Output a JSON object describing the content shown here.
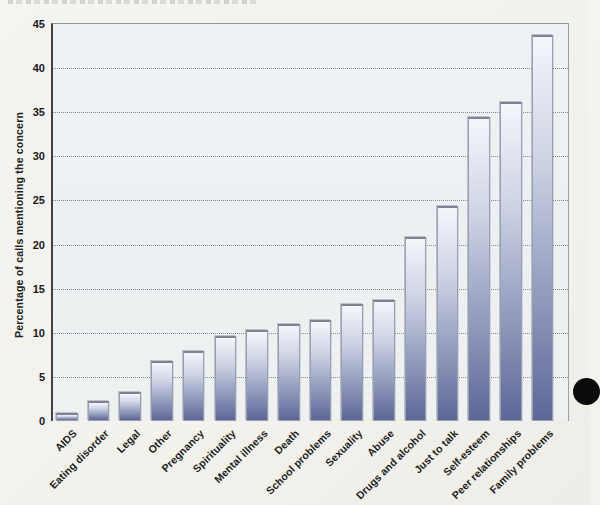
{
  "page": {
    "background_color": "#f2f1ec",
    "note": "scanned textbook bar-chart figure; caption line clipped at top edge (illegible); black hole-punch dot at right edge"
  },
  "chart_data": {
    "type": "bar",
    "title": "",
    "xlabel": "",
    "ylabel": "Percentage of calls mentioning the concern",
    "categories": [
      "AIDS",
      "Eating disorder",
      "Legal",
      "Other",
      "Pregnancy",
      "Spirituality",
      "Mental illness",
      "Death",
      "School problems",
      "Sexuality",
      "Abuse",
      "Drugs and alcohol",
      "Just to talk",
      "Self-esteem",
      "Peer relationships",
      "Family problems"
    ],
    "values": [
      0.9,
      2.3,
      3.3,
      6.8,
      7.9,
      9.6,
      10.3,
      11.0,
      11.5,
      13.3,
      13.7,
      20.9,
      24.4,
      34.5,
      36.2,
      43.8
    ],
    "ylim": [
      0,
      45
    ],
    "yticks": [
      0,
      5,
      10,
      15,
      20,
      25,
      30,
      35,
      40,
      45
    ],
    "grid": "horizontal dotted",
    "legend": "none",
    "xtick_rotation_deg": 45,
    "bar_gradient_top": "#f4f6fb",
    "bar_gradient_bottom": "#5e6698",
    "bar_border_color": "#99a0b0",
    "plot_background": "#edf1f3",
    "axis_color": "#3f4347"
  }
}
